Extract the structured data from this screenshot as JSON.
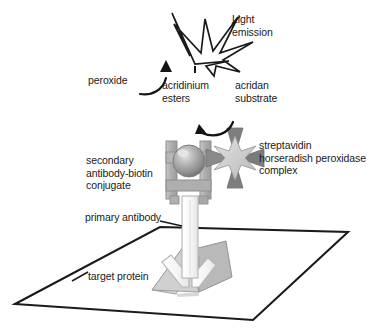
{
  "diagram": {
    "type": "biology-schematic",
    "background_color": "#ffffff",
    "line_color": "#1a1a1a",
    "labels": {
      "light_emission": "Light\nemission",
      "peroxide": "peroxide",
      "acridinium_esters": "acridinium\nesters",
      "acridan_substrate": "acridan\nsubstrate",
      "streptavidin_complex": "streptavidin\nhorseradish peroxidase\ncomplex",
      "secondary_antibody": "secondary\nantibody-biotin\nconjugate",
      "primary_antibody": "primary antibody",
      "target_protein": "target protein"
    },
    "elements": [
      {
        "name": "light-emission-starburst",
        "label": "Light emission",
        "shape": "irregular-7-point-starburst",
        "fill": "#ffffff",
        "stroke": "#1a1a1a"
      },
      {
        "name": "peroxide-arrow",
        "label": "peroxide",
        "shape": "curved-arrow",
        "direction": "up-right",
        "stroke": "#1a1a1a"
      },
      {
        "name": "acridan-substrate-arrow",
        "label": "acridan substrate",
        "shape": "curved-arrow",
        "direction": "up-left",
        "stroke": "#1a1a1a"
      },
      {
        "name": "streptavidin-hrp-complex",
        "label": "streptavidin horseradish peroxidase complex",
        "shape": "four-triangle-pinwheel-with-star",
        "fill_triangles": "#7a7a7a",
        "fill_star": "#cfcfcf",
        "stroke": "#8a8a8a"
      },
      {
        "name": "biotin-sphere",
        "label": "biotin",
        "shape": "sphere",
        "fill": "#9a9a9a",
        "highlight": "#d8d8d8"
      },
      {
        "name": "secondary-antibody",
        "label": "secondary antibody-biotin conjugate",
        "shape": "h-bracket",
        "fill": "#b2b2b2",
        "stroke": "#8f8f8f"
      },
      {
        "name": "primary-antibody",
        "label": "primary antibody",
        "shape": "y-fork",
        "fill": "#fbfbfb",
        "stroke": "#b0b0b0"
      },
      {
        "name": "target-protein",
        "label": "target protein",
        "shape": "folded-wedge",
        "fill_light": "#d2d2d2",
        "fill_dark": "#b4b4b4",
        "stroke": "#8a8a8a"
      },
      {
        "name": "substrate-plate",
        "label": "solid-phase plate surface",
        "shape": "parallelogram-outline",
        "fill": "none",
        "stroke": "#1a1a1a"
      }
    ]
  }
}
